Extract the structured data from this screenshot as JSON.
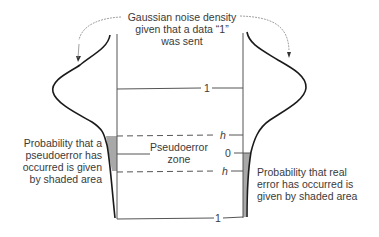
{
  "title_annotation": {
    "lines": [
      "Gaussian noise density",
      "given that a data “1”",
      "was sent"
    ]
  },
  "levels": {
    "top_one": "1",
    "upper_threshold": "h",
    "zero": "0",
    "lower_threshold": "h",
    "bottom_one": "1"
  },
  "zone_label": {
    "lines": [
      "Pseudoerror",
      "zone"
    ]
  },
  "left_annotation": {
    "lines": [
      "Probability that a",
      "pseudoerror has",
      "occurred is given",
      "by shaded area"
    ]
  },
  "right_annotation": {
    "lines": [
      "Probability that real",
      "error has occurred is",
      "given by shaded area"
    ]
  },
  "colors": {
    "line": "#555555",
    "curve": "#1a1a1a",
    "shade": "#a8a8a8",
    "text": "#3a3a3a"
  }
}
